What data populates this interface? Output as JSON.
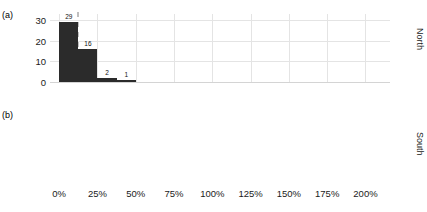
{
  "chart_data": {
    "type": "bar",
    "title": "",
    "subtitle": "",
    "xlabel": "",
    "ylabel": "",
    "xlim": [
      -6,
      216
    ],
    "ylim": [
      0,
      33
    ],
    "grid": true,
    "legend": false,
    "x_ticks": [
      {
        "value": 0,
        "label": "0%"
      },
      {
        "value": 25,
        "label": "25%"
      },
      {
        "value": 50,
        "label": "50%"
      },
      {
        "value": 75,
        "label": "75%"
      },
      {
        "value": 100,
        "label": "100%"
      },
      {
        "value": 125,
        "label": "125%"
      },
      {
        "value": 150,
        "label": "150%"
      },
      {
        "value": 175,
        "label": "175%"
      },
      {
        "value": 200,
        "label": "200%"
      }
    ],
    "y_ticks": [
      {
        "value": 0,
        "label": "0"
      },
      {
        "value": 10,
        "label": "10"
      },
      {
        "value": 20,
        "label": "20"
      },
      {
        "value": 30,
        "label": "30"
      }
    ],
    "bar_color": "#2b2b2b",
    "grid_color": "#e4e4e4",
    "refline_color": "#bfbfbf",
    "panels": [
      {
        "tag": "(a)",
        "strip_label": "North",
        "refline_x": 12.5,
        "bars": [
          {
            "x_start": 0.0,
            "x_end": 12.5,
            "value": 29,
            "label": "29"
          },
          {
            "x_start": 12.5,
            "x_end": 25.0,
            "value": 16,
            "label": "16"
          },
          {
            "x_start": 25.0,
            "x_end": 37.5,
            "value": 2,
            "label": "2"
          },
          {
            "x_start": 37.5,
            "x_end": 50.0,
            "value": 1,
            "label": "1"
          }
        ]
      },
      {
        "tag": "(b)",
        "strip_label": "South",
        "refline_x": 37.5,
        "bars": [
          {
            "x_start": 0.0,
            "x_end": 12.5,
            "value": 18,
            "label": "18"
          },
          {
            "x_start": 12.5,
            "x_end": 25.0,
            "value": 10,
            "label": "10"
          },
          {
            "x_start": 25.0,
            "x_end": 37.5,
            "value": 11,
            "label": "11"
          },
          {
            "x_start": 37.5,
            "x_end": 43.0,
            "value": 2,
            "label": "2"
          },
          {
            "x_start": 62.5,
            "x_end": 75.0,
            "value": 3,
            "label": "3"
          },
          {
            "x_start": 75.0,
            "x_end": 87.5,
            "value": 1,
            "label": "1"
          },
          {
            "x_start": 93.0,
            "x_end": 105.0,
            "value": 1,
            "label": "1"
          },
          {
            "x_start": 118.0,
            "x_end": 130.0,
            "value": 3,
            "label": "3"
          },
          {
            "x_start": 133.0,
            "x_end": 145.0,
            "value": 1,
            "label": "1"
          },
          {
            "x_start": 168.0,
            "x_end": 180.0,
            "value": 1,
            "label": "1"
          },
          {
            "x_start": 196.0,
            "x_end": 208.0,
            "value": 1,
            "label": "1"
          }
        ]
      }
    ]
  }
}
